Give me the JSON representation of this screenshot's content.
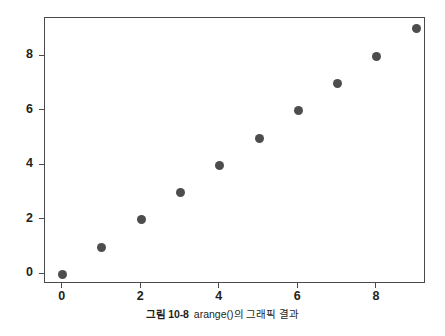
{
  "caption": {
    "label": "그림 10-8",
    "text": "arange()의 그래픽 결과"
  },
  "colors": {
    "marker": "#4d4d4d",
    "axis": "#4a4a4a",
    "background": "#ffffff",
    "text": "#231f20"
  },
  "chart_data": {
    "type": "scatter",
    "title": "",
    "xlabel": "",
    "ylabel": "",
    "x": [
      0,
      1,
      2,
      3,
      4,
      5,
      6,
      7,
      8,
      9
    ],
    "y": [
      0,
      1,
      2,
      3,
      4,
      5,
      6,
      7,
      8,
      9
    ],
    "series": [
      {
        "name": "arange()",
        "values": [
          0,
          1,
          2,
          3,
          4,
          5,
          6,
          7,
          8,
          9
        ]
      }
    ],
    "xlim": [
      -0.45,
      9.25
    ],
    "ylim": [
      -0.35,
      9.4
    ],
    "xticks": [
      0,
      2,
      4,
      6,
      8
    ],
    "yticks": [
      0,
      2,
      4,
      6,
      8
    ],
    "xticklabels": [
      "0",
      "2",
      "4",
      "6",
      "8"
    ],
    "yticklabels": [
      "0",
      "2",
      "4",
      "6",
      "8"
    ],
    "grid": false,
    "legend": false,
    "marker_style": "circle",
    "marker_color": "#4d4d4d"
  }
}
